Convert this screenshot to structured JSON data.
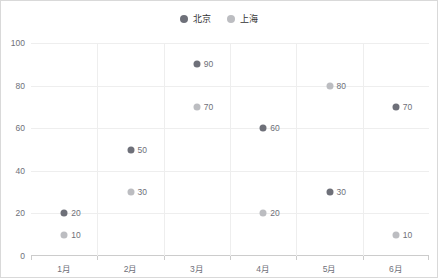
{
  "chart_data": {
    "type": "scatter",
    "title": "",
    "xlabel": "",
    "ylabel": "",
    "categories": [
      "1月",
      "2月",
      "3月",
      "4月",
      "5月",
      "6月"
    ],
    "ytick_labels": [
      "0",
      "20",
      "40",
      "60",
      "80",
      "100"
    ],
    "ytick_values": [
      0,
      20,
      40,
      60,
      80,
      100
    ],
    "ylim": [
      0,
      100
    ],
    "grid": true,
    "legend_position": "top-center",
    "show_point_labels": true,
    "series": [
      {
        "name": "北京",
        "color": "#6e7079",
        "values": [
          20,
          50,
          90,
          60,
          30,
          70
        ],
        "labels": [
          "20",
          "50",
          "90",
          "60",
          "30",
          "70"
        ]
      },
      {
        "name": "上海",
        "color": "#bcbdc1",
        "values": [
          10,
          30,
          70,
          20,
          80,
          10
        ],
        "labels": [
          "10",
          "30",
          "70",
          "20",
          "80",
          "10"
        ]
      }
    ]
  },
  "colors": {
    "series_1": "#6e7079",
    "series_2": "#bcbdc1",
    "gridline": "#eeeeee",
    "axis": "#cccccc",
    "axis_text": "#6e7079",
    "legend_text": "#333333",
    "border": "#d9d9d9",
    "background": "#ffffff"
  }
}
